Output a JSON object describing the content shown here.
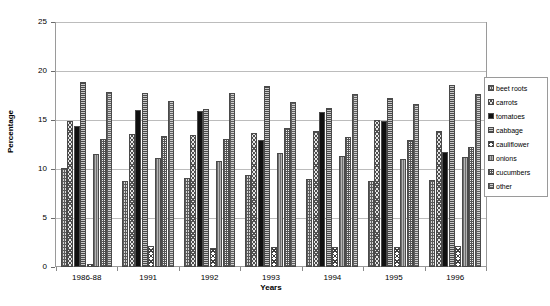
{
  "chart_data": {
    "type": "bar",
    "title": "",
    "subtitle": "",
    "xlabel": "Years",
    "ylabel": "Percentage",
    "ylim": [
      0,
      25
    ],
    "yticks": [
      0,
      5,
      10,
      15,
      20,
      25
    ],
    "grid": true,
    "legend_position": "right",
    "categories": [
      "1986-88",
      "1991",
      "1992",
      "1993",
      "1994",
      "1995",
      "1996"
    ],
    "series": [
      {
        "name": "beet roots",
        "pattern": "p-beetroots",
        "values": [
          10.1,
          8.8,
          9.1,
          9.4,
          9.0,
          8.8,
          8.9
        ]
      },
      {
        "name": "carrots",
        "pattern": "p-carrots",
        "values": [
          14.9,
          13.6,
          13.5,
          13.7,
          13.9,
          15.0,
          13.9
        ]
      },
      {
        "name": "tomatoes",
        "pattern": "p-tomatoes",
        "values": [
          14.4,
          16.0,
          15.9,
          13.0,
          15.8,
          14.9,
          11.7
        ]
      },
      {
        "name": "cabbage",
        "pattern": "p-cabbage",
        "values": [
          18.9,
          17.8,
          16.1,
          18.5,
          16.2,
          17.2,
          18.6
        ]
      },
      {
        "name": "cauliflower",
        "pattern": "p-cauliflower",
        "values": [
          0.3,
          2.1,
          1.9,
          2.0,
          2.0,
          2.0,
          2.1
        ]
      },
      {
        "name": "onions",
        "pattern": "p-onions",
        "values": [
          11.5,
          11.1,
          10.8,
          11.6,
          11.3,
          11.0,
          11.2
        ]
      },
      {
        "name": "cucumbers",
        "pattern": "p-cucumbers",
        "values": [
          13.1,
          13.4,
          13.1,
          14.2,
          13.3,
          13.0,
          12.2
        ]
      },
      {
        "name": "other",
        "pattern": "p-other",
        "values": [
          17.9,
          16.9,
          17.8,
          16.8,
          17.7,
          16.6,
          17.7
        ]
      }
    ]
  },
  "axes": {
    "y_title": "Percentage",
    "x_title": "Years"
  },
  "legend": {
    "items": [
      {
        "label": "beet roots"
      },
      {
        "label": "carrots"
      },
      {
        "label": "tomatoes"
      },
      {
        "label": "cabbage"
      },
      {
        "label": "cauliflower"
      },
      {
        "label": "onions"
      },
      {
        "label": "cucumbers"
      },
      {
        "label": "other"
      }
    ]
  }
}
